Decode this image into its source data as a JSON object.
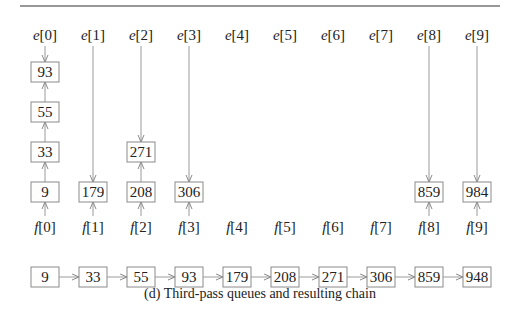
{
  "figure": {
    "caption": "(d) Third-pass queues and resulting chain",
    "head_labels": [
      "e[0]",
      "e[1]",
      "e[2]",
      "e[3]",
      "e[4]",
      "e[5]",
      "e[6]",
      "e[7]",
      "e[8]",
      "e[9]"
    ],
    "tail_labels": [
      "f[0]",
      "f[1]",
      "f[2]",
      "f[3]",
      "f[4]",
      "f[5]",
      "f[6]",
      "f[7]",
      "f[8]",
      "f[9]"
    ],
    "queues": [
      {
        "index": 0,
        "items_top_to_bottom": [
          "93",
          "55",
          "33",
          "9"
        ]
      },
      {
        "index": 1,
        "items_top_to_bottom": [
          "179"
        ]
      },
      {
        "index": 2,
        "items_top_to_bottom": [
          "271",
          "208"
        ]
      },
      {
        "index": 3,
        "items_top_to_bottom": [
          "306"
        ]
      },
      {
        "index": 4,
        "items_top_to_bottom": []
      },
      {
        "index": 5,
        "items_top_to_bottom": []
      },
      {
        "index": 6,
        "items_top_to_bottom": []
      },
      {
        "index": 7,
        "items_top_to_bottom": []
      },
      {
        "index": 8,
        "items_top_to_bottom": [
          "859"
        ]
      },
      {
        "index": 9,
        "items_top_to_bottom": [
          "984"
        ]
      }
    ],
    "chain": [
      "9",
      "33",
      "55",
      "93",
      "179",
      "208",
      "271",
      "306",
      "859",
      "948"
    ]
  }
}
